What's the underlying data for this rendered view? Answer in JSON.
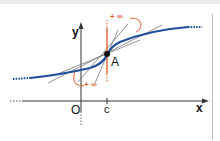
{
  "diagram": {
    "type": "function-graph",
    "axes": {
      "x_label": "x",
      "y_label": "y",
      "origin_label": "O"
    },
    "point": {
      "label": "A",
      "x_label": "c"
    },
    "annotations": {
      "upper_limit": "+ ∞",
      "lower_limit": "+ ∞"
    },
    "colors": {
      "curve": "#1f4e9c",
      "vertical_tangent": "#e0622f",
      "secant_lines": "#777777",
      "axes": "#333333"
    }
  }
}
